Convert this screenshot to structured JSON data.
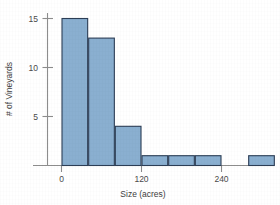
{
  "chart_data": {
    "type": "bar",
    "title": "",
    "subtitle": "",
    "xlabel": "Size (acres)",
    "ylabel": "# of Vineyards",
    "grid": false,
    "legend": false,
    "legend_position": "none",
    "bin_width": 40,
    "bin_edges": [
      0,
      40,
      80,
      120,
      160,
      200,
      240,
      280,
      320
    ],
    "categories": [
      "0-40",
      "40-80",
      "80-120",
      "120-160",
      "160-200",
      "200-240",
      "240-280",
      "280-320"
    ],
    "values": [
      15,
      13,
      4,
      1,
      1,
      1,
      0,
      1
    ],
    "x": [
      20,
      60,
      100,
      140,
      180,
      220,
      260,
      300
    ],
    "xlim": [
      -15,
      335
    ],
    "ylim": [
      0,
      15.6
    ],
    "xticks": [
      0,
      120,
      240
    ],
    "xtick_labels": [
      "0",
      "120",
      "240"
    ],
    "yticks": [
      5,
      10,
      15
    ],
    "ytick_labels": [
      "5",
      "10",
      "15"
    ],
    "bar_fill_color": "#8aafd0",
    "bar_edge_color": "#2c3e56",
    "axis_color": "#8d8d8d",
    "text_color": "#3d3d3d",
    "background_color": "#ffffff"
  }
}
